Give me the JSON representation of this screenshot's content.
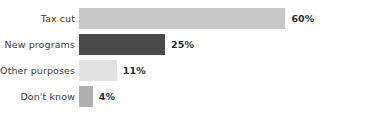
{
  "chart_data": {
    "type": "bar",
    "orientation": "horizontal",
    "title": "",
    "subtitle": "",
    "xlabel": "",
    "ylabel": "",
    "grid": false,
    "legend": "none",
    "axis_visible": false,
    "xlim": [
      0,
      60
    ],
    "value_suffix": "%",
    "categories": [
      "Tax cut",
      "New programs",
      "Other purposes",
      "Don't know"
    ],
    "values": [
      60,
      25,
      11,
      4
    ],
    "value_labels": [
      "60%",
      "25%",
      "11%",
      "4%"
    ],
    "bar_colors": [
      "#c8c8c8",
      "#4a4a4a",
      "#e2e2e2",
      "#b0b0b0"
    ],
    "bars": [
      {
        "category": "Tax cut",
        "value": 60,
        "value_label": "60%",
        "color": "#c8c8c8"
      },
      {
        "category": "New programs",
        "value": 25,
        "value_label": "25%",
        "color": "#4a4a4a"
      },
      {
        "category": "Other purposes",
        "value": 11,
        "value_label": "11%",
        "color": "#e2e2e2"
      },
      {
        "category": "Don't know",
        "value": 4,
        "value_label": "4%",
        "color": "#b0b0b0"
      }
    ]
  },
  "layout": {
    "bar_origin_x": 79,
    "px_per_percent": 3.44,
    "bar_height": 21,
    "row_top": [
      8,
      34,
      60,
      86
    ],
    "label_gap": 6,
    "background": "#ffffff",
    "label_color": "#3c3c3c",
    "value_color": "#2b2b2b"
  }
}
